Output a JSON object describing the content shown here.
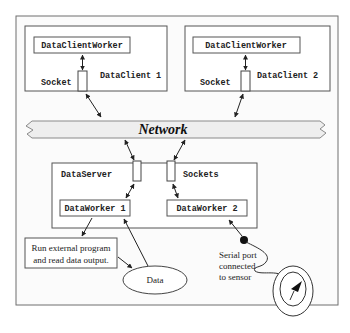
{
  "diagram": {
    "clients": [
      {
        "worker_label": "DataClientWorker",
        "socket_label": "Socket",
        "client_label": "DataClient 1"
      },
      {
        "worker_label": "DataClientWorker",
        "socket_label": "Socket",
        "client_label": "DataClient 2"
      }
    ],
    "network": {
      "label": "Network"
    },
    "server": {
      "label": "DataServer",
      "sockets_label": "Sockets",
      "workers": [
        {
          "label": "DataWorker 1"
        },
        {
          "label": "DataWorker 2"
        }
      ]
    },
    "external_program": {
      "line1": "Run external program",
      "line2": "and read data output."
    },
    "data_node": {
      "label": "Data"
    },
    "serial": {
      "line1": "Serial port",
      "line2": "connected",
      "line3": "to sensor"
    },
    "colors": {
      "stroke": "#444444",
      "frame": "#6f6f6f",
      "frame_fill": "#fbfbfb",
      "network_fill": "#eeeeee"
    }
  }
}
